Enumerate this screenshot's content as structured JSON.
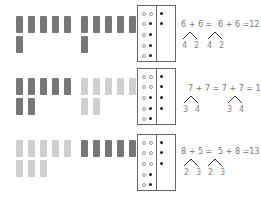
{
  "colors": {
    "dark_block": "#777777",
    "light_block": "#cfcfcf",
    "frame_border": "#666666",
    "text": "#777777"
  },
  "rows": [
    {
      "top": 16,
      "group_a": {
        "count": 6,
        "shade": "dark",
        "x": 16
      },
      "group_b": {
        "count": 6,
        "shade": "dark",
        "x": 81
      },
      "frame": {
        "top": 5,
        "col1_open": 5,
        "col2": [
          "open",
          "filled",
          "filled",
          "filled",
          "filled"
        ],
        "col3_filled": 2
      },
      "equation_left": "6 + 6 =",
      "equation_right": "6 + 6 =12",
      "split_left": [
        "4",
        "2"
      ],
      "split_right": [
        "4",
        "2"
      ]
    },
    {
      "top": 78,
      "group_a": {
        "count": 7,
        "shade": "dark",
        "x": 16
      },
      "group_b": {
        "count": 7,
        "shade": "light",
        "x": 81
      },
      "frame": {
        "top": 68,
        "col1_open": 5,
        "col2": [
          "open",
          "open",
          "filled",
          "filled",
          "filled"
        ],
        "col3_filled": 4
      },
      "equation_left": "7 + 7 = 7 + 7 = 14",
      "equation_right": "",
      "split_left": [
        "3",
        "4"
      ],
      "split_right": [
        "3",
        "4"
      ]
    },
    {
      "top": 140,
      "group_a": {
        "count": 8,
        "shade": "light",
        "x": 16
      },
      "group_b": {
        "count": 5,
        "shade": "dark",
        "x": 81
      },
      "frame": {
        "top": 134,
        "col1_open": 5,
        "col2": [
          "open",
          "open",
          "open",
          "filled",
          "filled"
        ],
        "col3_filled": 3
      },
      "equation_left": "8 + 5 =",
      "equation_right": "5 + 8 =13",
      "split_left": [
        "2",
        "3"
      ],
      "split_right": [
        "2",
        "3"
      ]
    }
  ]
}
